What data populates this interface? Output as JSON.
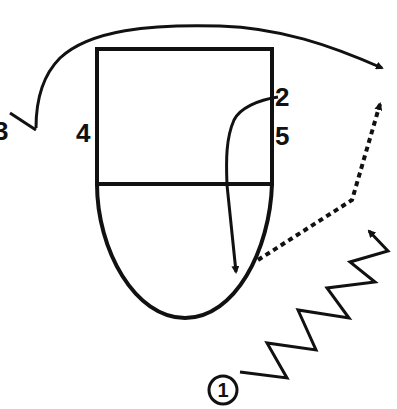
{
  "diagram": {
    "type": "play-diagram",
    "colors": {
      "stroke": "#111111",
      "background": "#ffffff"
    },
    "court": {
      "shape": "rectangle-with-rounded-bottom",
      "box": {
        "x": 97,
        "y": 49,
        "width": 175,
        "height": 135
      },
      "bottom_arc_lowest_point": {
        "x": 185,
        "y": 318
      }
    },
    "players": [
      {
        "id": "1",
        "label": "1",
        "circled": true,
        "position": {
          "x": 223,
          "y": 390
        }
      },
      {
        "id": "2",
        "label": "2",
        "circled": false,
        "position": {
          "x": 284,
          "y": 95
        }
      },
      {
        "id": "3",
        "label": "3",
        "circled": false,
        "position": {
          "x": 3,
          "y": 130
        }
      },
      {
        "id": "4",
        "label": "4",
        "circled": false,
        "position": {
          "x": 86,
          "y": 132
        }
      },
      {
        "id": "5",
        "label": "5",
        "circled": false,
        "position": {
          "x": 284,
          "y": 134
        }
      }
    ],
    "paths": [
      {
        "name": "cut-3-curve",
        "style": "solid-arrow",
        "from": "3",
        "description": "curved arc over top of court ending at right with arrow"
      },
      {
        "name": "cut-2-down",
        "style": "solid-arrow",
        "from": "2",
        "description": "curves left then down into bottom arc"
      },
      {
        "name": "pass-dotted",
        "style": "dotted-arrow",
        "description": "dotted line from arc edge right and up"
      },
      {
        "name": "dribble-1",
        "style": "zigzag-arrow",
        "from": "1",
        "description": "zigzag dribble path upward right"
      }
    ]
  }
}
